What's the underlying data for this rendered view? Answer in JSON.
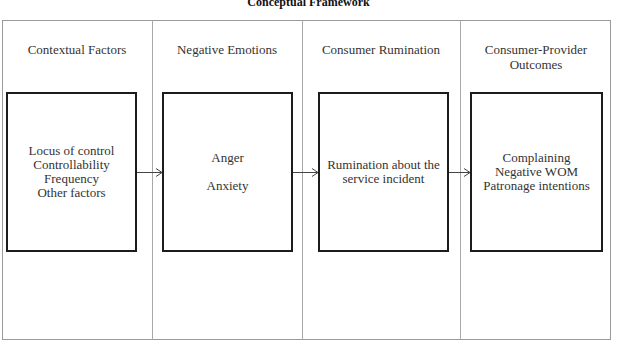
{
  "title": "Conceptual Framework",
  "columns": [
    {
      "header": "Contextual Factors",
      "box_lines": [
        "Locus of control",
        "Controllability",
        "Frequency",
        "Other factors"
      ]
    },
    {
      "header": "Negative Emotions",
      "box_lines": [
        "Anger",
        "Anxiety"
      ]
    },
    {
      "header": "Consumer Rumination",
      "box_lines": [
        "Rumination about the",
        "service incident"
      ]
    },
    {
      "header_lines": [
        "Consumer-Provider",
        "Outcomes"
      ],
      "box_lines": [
        "Complaining",
        "Negative WOM",
        "Patronage intentions"
      ]
    }
  ],
  "arrows": [
    {
      "from": "Contextual Factors",
      "to": "Negative Emotions",
      "icon": "arrow-right-icon"
    },
    {
      "from": "Negative Emotions",
      "to": "Consumer Rumination",
      "icon": "arrow-right-icon"
    },
    {
      "from": "Consumer Rumination",
      "to": "Consumer-Provider Outcomes",
      "icon": "arrow-right-icon"
    }
  ]
}
